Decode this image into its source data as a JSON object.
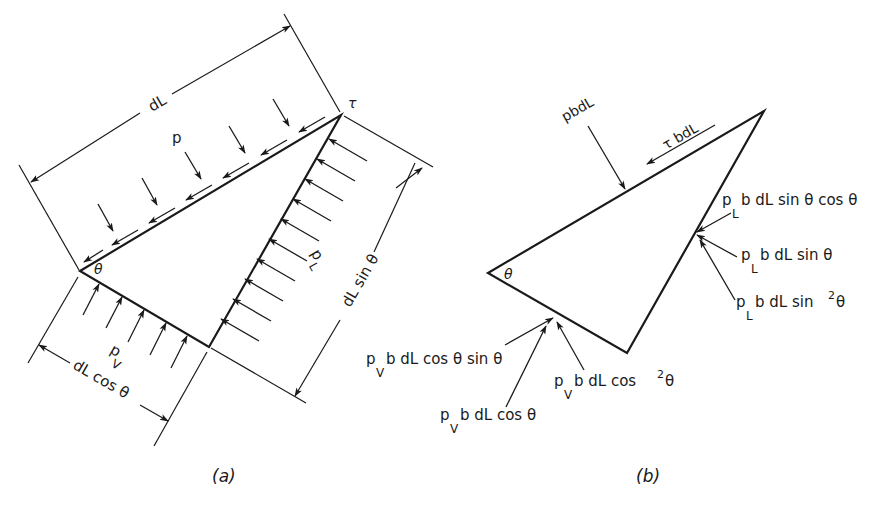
{
  "figure": {
    "part_a": {
      "caption": "(a)",
      "labels": {
        "dL": "dL",
        "p": "p",
        "tau": "τ",
        "theta": "θ",
        "pL_base": "p",
        "pL_sub": "L",
        "pV_base": "p",
        "pV_sub": "V",
        "dL_sin_theta": "dL sin θ",
        "dL_cos_theta": "dL cos θ"
      }
    },
    "part_b": {
      "caption": "(b)",
      "labels": {
        "theta": "θ",
        "pbdL": "pbdL",
        "tau_bdL": "τ bdL",
        "pL_sin_cos": {
          "base": "p",
          "sub": "L",
          "rest": "b dL sin θ cos θ"
        },
        "pL_sin": {
          "base": "p",
          "sub": "L",
          "rest": "b dL sin θ"
        },
        "pL_sin2": {
          "base": "p",
          "sub": "L",
          "rest": "b dL sin",
          "sup": "2",
          "tail": "θ"
        },
        "pV_cos_sin": {
          "base": "p",
          "sub": "V",
          "rest": "b dL cos θ  sin θ"
        },
        "pV_cos2": {
          "base": "p",
          "sub": "V",
          "rest": "b  dL  cos",
          "sup": "2",
          "tail": "θ"
        },
        "pV_cos": {
          "base": "p",
          "sub": "V",
          "rest": "b  dL  cos θ"
        }
      }
    },
    "colors": {
      "ink": "#1a1a1a",
      "background": "#ffffff"
    }
  }
}
